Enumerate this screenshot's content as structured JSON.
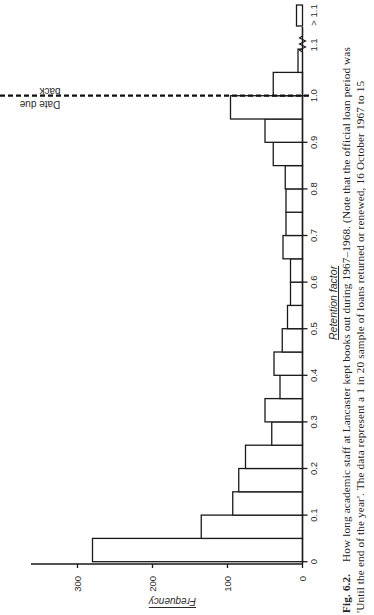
{
  "figure": {
    "orientation": "rotated 90° counter-clockwise on page",
    "caption_label": "Fig. 6.2.",
    "caption_line1": "How long academic staff at Lancaster kept books out during 1967–1968. (Note that the official loan period was",
    "caption_line2": "'Until the end of the year'. The data represent a 1 in 20 sample of loans returned or renewed, 16 October 1967 to 15"
  },
  "chart_data": {
    "type": "bar",
    "title": "How long academic staff at Lancaster kept books out during 1967–1968",
    "xlabel": "Retention factor",
    "ylabel": "Frequency",
    "ylim": [
      0,
      330
    ],
    "xlim": [
      0,
      1.15
    ],
    "grid": false,
    "legend": null,
    "x_ticks": [
      "0",
      "0.1",
      "0.2",
      "0.3",
      "0.4",
      "0.5",
      "0.6",
      "0.7",
      "0.8",
      "0.9",
      "1.0",
      "1.1",
      "> 1.1"
    ],
    "y_ticks": [
      "0",
      "100",
      "200",
      "300"
    ],
    "bin_width": 0.05,
    "categories": [
      "0–0.05",
      "0.05–0.10",
      "0.10–0.15",
      "0.15–0.20",
      "0.20–0.25",
      "0.25–0.30",
      "0.30–0.35",
      "0.35–0.40",
      "0.40–0.45",
      "0.45–0.50",
      "0.50–0.55",
      "0.55–0.60",
      "0.60–0.65",
      "0.65–0.70",
      "0.70–0.75",
      "0.75–0.80",
      "0.80–0.85",
      "0.85–0.90",
      "0.90–0.95",
      "0.95–1.00",
      "1.00–1.05",
      "1.05–1.10",
      "> 1.1"
    ],
    "bins": [
      {
        "start": 0.0,
        "end": 0.05,
        "value": 280
      },
      {
        "start": 0.05,
        "end": 0.1,
        "value": 135
      },
      {
        "start": 0.1,
        "end": 0.15,
        "value": 93
      },
      {
        "start": 0.15,
        "end": 0.2,
        "value": 85
      },
      {
        "start": 0.2,
        "end": 0.25,
        "value": 76
      },
      {
        "start": 0.25,
        "end": 0.3,
        "value": 41
      },
      {
        "start": 0.3,
        "end": 0.35,
        "value": 50
      },
      {
        "start": 0.35,
        "end": 0.4,
        "value": 30
      },
      {
        "start": 0.4,
        "end": 0.45,
        "value": 38
      },
      {
        "start": 0.45,
        "end": 0.5,
        "value": 27
      },
      {
        "start": 0.5,
        "end": 0.55,
        "value": 20
      },
      {
        "start": 0.55,
        "end": 0.6,
        "value": 16
      },
      {
        "start": 0.6,
        "end": 0.65,
        "value": 16
      },
      {
        "start": 0.65,
        "end": 0.7,
        "value": 26
      },
      {
        "start": 0.7,
        "end": 0.75,
        "value": 22
      },
      {
        "start": 0.75,
        "end": 0.8,
        "value": 22
      },
      {
        "start": 0.8,
        "end": 0.85,
        "value": 23
      },
      {
        "start": 0.85,
        "end": 0.9,
        "value": 39
      },
      {
        "start": 0.9,
        "end": 0.95,
        "value": 50
      },
      {
        "start": 0.95,
        "end": 1.0,
        "value": 96
      },
      {
        "start": 1.0,
        "end": 1.05,
        "value": 39
      },
      {
        "start": 1.05,
        "end": 1.1,
        "value": 6
      },
      {
        "start": 1.15,
        "end": 1.2,
        "value": 8,
        "label": "> 1.1",
        "after_axis_break": true
      }
    ],
    "values": [
      280,
      135,
      93,
      85,
      76,
      41,
      50,
      30,
      38,
      27,
      20,
      16,
      16,
      26,
      22,
      22,
      23,
      39,
      50,
      96,
      39,
      6,
      8
    ],
    "annotations": [
      {
        "type": "dashed-vertical-line",
        "x": 1.0,
        "text_above": "back",
        "text_below": "Date due",
        "full_text": "Date due back"
      },
      {
        "type": "axis-break",
        "x": 1.12
      }
    ]
  }
}
